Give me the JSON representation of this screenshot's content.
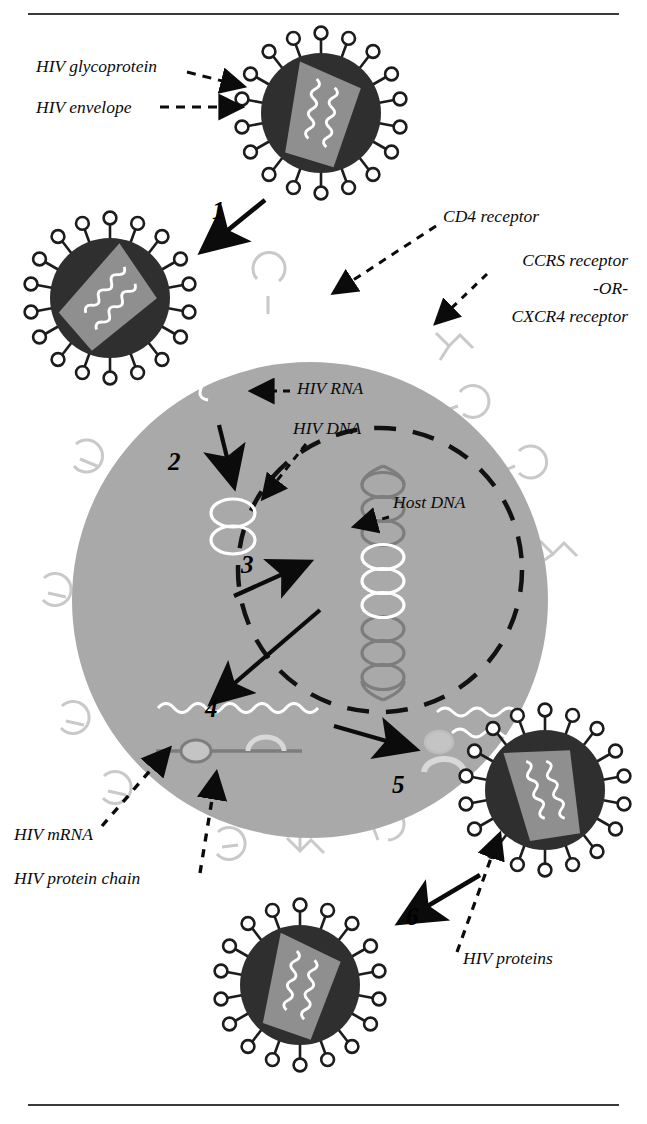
{
  "figure": {
    "rules": {
      "top_y": 14,
      "bottom_y": 1105
    },
    "colors": {
      "background": "#ffffff",
      "virus_envelope": "#2f2f2f",
      "virus_capsid": "#8f8f8f",
      "cell_body": "#a9a9a9",
      "receptor_outline": "#c9c9c9",
      "host_dna": "#7d7d7d",
      "hiv_nucleic_acid": "#ffffff",
      "ink": "#0b0b0b"
    }
  },
  "labels": [
    {
      "id": "hiv-glycoprotein",
      "text": "HIV glycoprotein",
      "x": 36,
      "y": 72,
      "anchor": "start"
    },
    {
      "id": "hiv-envelope",
      "text": "HIV envelope",
      "x": 36,
      "y": 113,
      "anchor": "start"
    },
    {
      "id": "cd4-receptor",
      "text": "CD4 receptor",
      "x": 443,
      "y": 222,
      "anchor": "start"
    },
    {
      "id": "ccr5-receptor",
      "text": "CCRS receptor",
      "x": 628,
      "y": 266,
      "anchor": "end"
    },
    {
      "id": "or-separator",
      "text": "-OR-",
      "x": 628,
      "y": 294,
      "anchor": "end"
    },
    {
      "id": "cxcr4-receptor",
      "text": "CXCR4 receptor",
      "x": 628,
      "y": 322,
      "anchor": "end"
    },
    {
      "id": "hiv-rna",
      "text": "HIV RNA",
      "x": 297,
      "y": 394,
      "anchor": "start"
    },
    {
      "id": "hiv-dna",
      "text": "HIV DNA",
      "x": 293,
      "y": 434,
      "anchor": "start"
    },
    {
      "id": "host-dna",
      "text": "Host DNA",
      "x": 393,
      "y": 508,
      "anchor": "start"
    },
    {
      "id": "hiv-mrna",
      "text": "HIV mRNA",
      "x": 14,
      "y": 840,
      "anchor": "start"
    },
    {
      "id": "hiv-protein-chain",
      "text": "HIV protein chain",
      "x": 14,
      "y": 884,
      "anchor": "start"
    },
    {
      "id": "hiv-proteins",
      "text": "HIV proteins",
      "x": 463,
      "y": 964,
      "anchor": "start"
    }
  ],
  "steps": [
    {
      "id": "step-1",
      "text": "1",
      "x": 212,
      "y": 219
    },
    {
      "id": "step-2",
      "text": "2",
      "x": 168,
      "y": 470
    },
    {
      "id": "step-3",
      "text": "3",
      "x": 241,
      "y": 573
    },
    {
      "id": "step-4",
      "text": "4",
      "x": 205,
      "y": 717
    },
    {
      "id": "step-5",
      "text": "5",
      "x": 392,
      "y": 793
    },
    {
      "id": "step-6",
      "text": "6",
      "x": 406,
      "y": 925
    }
  ],
  "virions": [
    {
      "id": "virion-incoming",
      "cx": 321,
      "cy": 113,
      "r": 63,
      "spikes": 18,
      "state": "free"
    },
    {
      "id": "virion-fusing",
      "cx": 110,
      "cy": 298,
      "r": 63,
      "spikes": 18,
      "state": "binding"
    },
    {
      "id": "virion-budding",
      "cx": 545,
      "cy": 790,
      "r": 63,
      "spikes": 18,
      "state": "budding"
    },
    {
      "id": "virion-released",
      "cx": 300,
      "cy": 985,
      "r": 63,
      "spikes": 18,
      "state": "released"
    }
  ],
  "cell": {
    "id": "host-cell",
    "cx": 310,
    "cy": 600,
    "r": 238
  },
  "nucleus": {
    "id": "cell-nucleus",
    "cx": 380,
    "cy": 570,
    "r": 142,
    "style": "dashed"
  },
  "receptors": {
    "cd4_count": 9,
    "coreceptor_count": 4,
    "cd4_shape": "crescent",
    "coreceptor_shape": "bracket"
  }
}
